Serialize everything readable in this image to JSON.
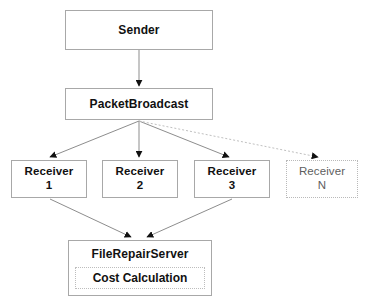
{
  "diagram": {
    "background_color": "#ffffff",
    "box_border_color": "#a8a8a8",
    "dotted_border_color": "#b9b9b9",
    "edge_color": "#8d8d8d",
    "dotted_edge_color": "#c0c0c0",
    "text_color": "#111111",
    "muted_text_color": "#5e5e5e",
    "nodes": {
      "sender": {
        "label": "Sender"
      },
      "broadcast": {
        "label": "PacketBroadcast"
      },
      "receiver_1": {
        "label_line1": "Receiver",
        "label_line2": "1"
      },
      "receiver_2": {
        "label_line1": "Receiver",
        "label_line2": "2"
      },
      "receiver_3": {
        "label_line1": "Receiver",
        "label_line2": "3"
      },
      "receiver_n": {
        "label_line1": "Receiver",
        "label_line2": "N"
      },
      "file_repair_server": {
        "label": "FileRepairServer",
        "sub_label": "Cost Calculation"
      }
    }
  }
}
